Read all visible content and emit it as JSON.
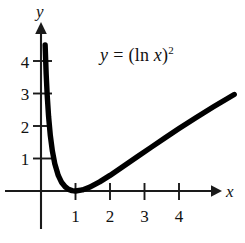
{
  "figure": {
    "title": "",
    "equation_label": {
      "lhs": "y",
      "operator": "=",
      "rhs_open": "(ln ",
      "rhs_var": "x",
      "rhs_close": ")",
      "rhs_exponent": "2",
      "full_text": "y = (ln x)2"
    },
    "axes": {
      "x_axis_label": "x",
      "y_axis_label": "y",
      "x_ticks": [
        "1",
        "2",
        "3",
        "4"
      ],
      "y_ticks": [
        "1",
        "2",
        "3",
        "4"
      ]
    },
    "colors": {
      "curve": "#000000",
      "axis": "#1a1a1a",
      "text": "#111111",
      "background": "#ffffff"
    }
  },
  "chart_data": {
    "type": "line",
    "title": "",
    "subtitle": "",
    "xlabel": "x",
    "ylabel": "y",
    "annotations": [
      "y = (ln x)^2"
    ],
    "legend": [],
    "legend_position": "none",
    "grid": false,
    "xlim": [
      0,
      5.9
    ],
    "ylim": [
      -0.35,
      5.3
    ],
    "xticks": [
      1,
      2,
      3,
      4
    ],
    "yticks": [
      1,
      2,
      3,
      4
    ],
    "series": [
      {
        "name": "y = (ln x)^2",
        "x": [
          0.12,
          0.15,
          0.18,
          0.22,
          0.27,
          0.33,
          0.4,
          0.5,
          0.6,
          0.7,
          0.8,
          0.9,
          1.0,
          1.2,
          1.4,
          1.7,
          2.0,
          2.4,
          2.8,
          3.2,
          3.6,
          4.0,
          4.5,
          5.0,
          5.6
        ],
        "y": [
          4.49,
          3.6,
          2.94,
          2.29,
          1.71,
          1.23,
          0.84,
          0.48,
          0.26,
          0.13,
          0.05,
          0.011,
          0.0,
          0.033,
          0.113,
          0.282,
          0.48,
          0.767,
          1.06,
          1.35,
          1.64,
          1.92,
          2.26,
          2.59,
          2.97
        ]
      }
    ]
  }
}
